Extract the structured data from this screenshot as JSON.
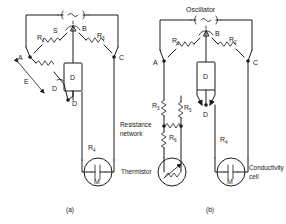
{
  "figure": {
    "type": "circuit-diagram",
    "panels": [
      {
        "id": "a",
        "caption": "(a)",
        "source": {
          "label": "",
          "symbol": "~",
          "name": "ac-source"
        },
        "nodes": [
          {
            "id": "A",
            "label": "A"
          },
          {
            "id": "B",
            "label": "B"
          },
          {
            "id": "C",
            "label": "C"
          },
          {
            "id": "D",
            "label": "D"
          }
        ],
        "components": [
          {
            "name": "R1",
            "label": "R",
            "sub": "1",
            "type": "resistor"
          },
          {
            "name": "S",
            "label": "S",
            "sub": "",
            "type": "slider-contact"
          },
          {
            "name": "R2",
            "label": "R",
            "sub": "2",
            "type": "resistor"
          },
          {
            "name": "R3",
            "label": "R",
            "sub": "3",
            "type": "variable-resistor"
          },
          {
            "name": "E",
            "label": "E",
            "sub": "",
            "type": "slide-wire"
          },
          {
            "name": "D",
            "label": "D",
            "sub": "",
            "type": "detector"
          },
          {
            "name": "R4",
            "label": "R",
            "sub": "4",
            "type": "resistor"
          },
          {
            "name": "M",
            "label": "M",
            "sub": "",
            "type": "cell"
          }
        ]
      },
      {
        "id": "b",
        "caption": "(b)",
        "source": {
          "label": "Oscillator",
          "symbol": "~",
          "name": "oscillator"
        },
        "nodes": [
          {
            "id": "A",
            "label": "A"
          },
          {
            "id": "B",
            "label": "B"
          },
          {
            "id": "C",
            "label": "C"
          },
          {
            "id": "D",
            "label": "D"
          }
        ],
        "components": [
          {
            "name": "R1",
            "label": "R",
            "sub": "1",
            "type": "resistor"
          },
          {
            "name": "R2",
            "label": "R",
            "sub": "2",
            "type": "resistor"
          },
          {
            "name": "R3",
            "label": "R",
            "sub": "3",
            "type": "resistor"
          },
          {
            "name": "R5",
            "label": "R",
            "sub": "5",
            "type": "resistor"
          },
          {
            "name": "R6",
            "label": "R",
            "sub": "6",
            "type": "resistor"
          },
          {
            "name": "D",
            "label": "D",
            "sub": "",
            "type": "detector"
          },
          {
            "name": "R4",
            "label": "R",
            "sub": "4",
            "type": "resistor"
          },
          {
            "name": "M",
            "label": "M",
            "sub": "",
            "type": "cell"
          }
        ],
        "annotations": [
          {
            "name": "resistance-network",
            "line1": "Resistance",
            "line2": "network"
          },
          {
            "name": "thermistor",
            "line1": "Thermistor",
            "line2": ""
          },
          {
            "name": "conductivity-cell",
            "line1": "Conductivity",
            "line2": "cell"
          }
        ]
      }
    ]
  },
  "colors": {
    "ink": "#1a1a1a",
    "paper": "#ffffff"
  }
}
